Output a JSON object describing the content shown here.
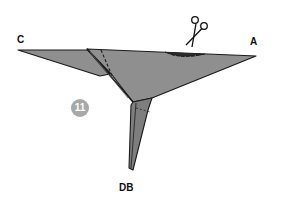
{
  "diagram": {
    "type": "origami-fold-step",
    "step_number": "11",
    "labels": {
      "corner_left": "C",
      "corner_right": "A",
      "corner_bottom": "DB"
    },
    "icons": [
      "scissors-icon"
    ],
    "colors": {
      "paper_fill": "#8f8f8f",
      "paper_fill_dark": "#6f6f6f",
      "outline": "#1a1a1a",
      "step_badge": "#a8a8a8",
      "background": "#ffffff"
    }
  }
}
